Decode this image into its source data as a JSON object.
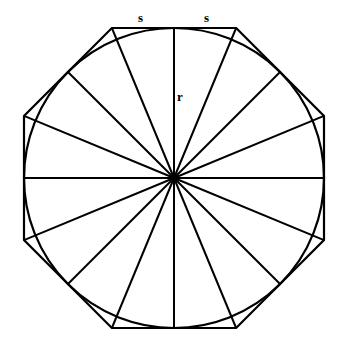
{
  "diagram": {
    "title": "",
    "labels": {
      "side_left": "s",
      "side_right": "s",
      "radius": "r"
    },
    "shapes": {
      "octagon": {
        "center": [
          174,
          178
        ],
        "apothem": 150,
        "stroke": "#000000"
      },
      "circle": {
        "center": [
          174,
          178
        ],
        "radius": 150,
        "stroke": "#000000"
      },
      "spokes": 16
    }
  }
}
